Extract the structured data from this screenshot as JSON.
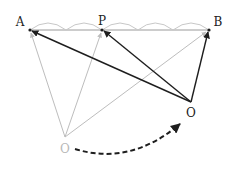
{
  "diagram": {
    "points": {
      "A": {
        "label": "A",
        "x": 30,
        "y": 30,
        "label_x": 20,
        "label_y": 22
      },
      "P": {
        "label": "P",
        "x": 102,
        "y": 30,
        "label_x": 102,
        "label_y": 21
      },
      "B": {
        "label": "B",
        "x": 209,
        "y": 30,
        "label_x": 218,
        "label_y": 22
      },
      "O_new": {
        "label": "O",
        "x": 191,
        "y": 102,
        "label_x": 191,
        "label_y": 113
      },
      "O_old": {
        "label": "O",
        "x": 65,
        "y": 137,
        "label_x": 65,
        "label_y": 149
      }
    },
    "segment_arcs": {
      "between_A_P": 2,
      "between_P_B": 3,
      "total": 5
    },
    "colors": {
      "dark": "#1e1e1e",
      "faded": "#bdbdbd",
      "arc": "#c8c8c8"
    }
  }
}
